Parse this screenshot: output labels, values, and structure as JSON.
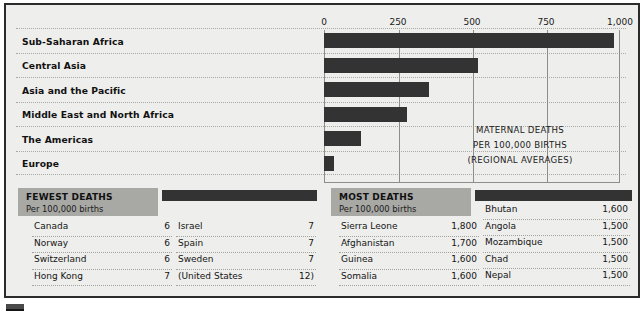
{
  "chart_data": {
    "type": "bar",
    "title": "MATERNAL DEATHS",
    "subtitle": "PER 100,000 BIRTHS",
    "note": "(REGIONAL AVERAGES)",
    "orientation": "horizontal",
    "xlabel": "",
    "ylabel": "",
    "xlim": [
      0,
      1000
    ],
    "grid": true,
    "ticks": [
      "0",
      "250",
      "500",
      "750",
      "1,000"
    ],
    "tick_values": [
      0,
      250,
      500,
      750,
      1000
    ],
    "categories": [
      "Sub-Saharan Africa",
      "Central Asia",
      "Asia and the Pacific",
      "Middle East and North Africa",
      "The Americas",
      "Europe"
    ],
    "values": [
      980,
      520,
      355,
      280,
      125,
      35
    ],
    "bar_color": "#333333"
  },
  "tables": [
    {
      "title": "FEWEST DEATHS",
      "subtitle": "Per 100,000 births",
      "columns": [
        {
          "rows": [
            {
              "name": "Canada",
              "value": "6"
            },
            {
              "name": "Norway",
              "value": "6"
            },
            {
              "name": "Switzerland",
              "value": "6"
            },
            {
              "name": "Hong Kong",
              "value": "7"
            }
          ]
        },
        {
          "rows": [
            {
              "name": "Israel",
              "value": "7"
            },
            {
              "name": "Spain",
              "value": "7"
            },
            {
              "name": "Sweden",
              "value": "7"
            },
            {
              "name": "(United States",
              "value": "12)"
            }
          ]
        }
      ]
    },
    {
      "title": "MOST DEATHS",
      "subtitle": "Per 100,000 births",
      "columns": [
        {
          "rows": [
            {
              "name": "Sierra Leone",
              "value": "1,800"
            },
            {
              "name": "Afghanistan",
              "value": "1,700"
            },
            {
              "name": "Guinea",
              "value": "1,600"
            },
            {
              "name": "Somalia",
              "value": "1,600"
            }
          ]
        },
        {
          "rows": [
            {
              "name": "Bhutan",
              "value": "1,600"
            },
            {
              "name": "Angola",
              "value": "1,500"
            },
            {
              "name": "Mozambique",
              "value": "1,500"
            },
            {
              "name": "Chad",
              "value": "1,500"
            },
            {
              "name": "Nepal",
              "value": "1,500"
            }
          ]
        }
      ]
    }
  ]
}
